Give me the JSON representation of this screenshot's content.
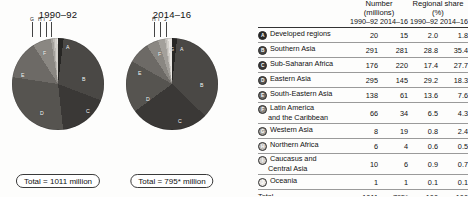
{
  "charts": [
    {
      "title": "1990–92",
      "total_label": "Total = 1011 million",
      "period": "1990-92",
      "leader_labels": [
        "G",
        "H",
        "I",
        "J"
      ],
      "inner_labels": [
        "A",
        "B",
        "C",
        "D",
        "E",
        "F"
      ]
    },
    {
      "title": "2014–16",
      "total_label": "Total = 795* million",
      "period": "2014-16",
      "leader_labels": [
        "H",
        "I",
        "J"
      ],
      "inner_labels": [
        "A",
        "B",
        "C",
        "D",
        "E",
        "F",
        "G"
      ]
    }
  ],
  "table": {
    "group_headers": [
      {
        "line1": "Number",
        "line2": "(millions)"
      },
      {
        "line1": "Regional share",
        "line2": "(%)"
      }
    ],
    "sub_headers": [
      "1990–92",
      "2014–16",
      "1990–92",
      "2014–16"
    ],
    "rows": [
      {
        "key": "A",
        "name": "Developed regions",
        "name2": "",
        "number_1990": "20",
        "number_2014": "15",
        "share_1990": "2.0",
        "share_2014": "1.8"
      },
      {
        "key": "B",
        "name": "Southern Asia",
        "name2": "",
        "number_1990": "291",
        "number_2014": "281",
        "share_1990": "28.8",
        "share_2014": "35.4"
      },
      {
        "key": "C",
        "name": "Sub-Saharan Africa",
        "name2": "",
        "number_1990": "176",
        "number_2014": "220",
        "share_1990": "17.4",
        "share_2014": "27.7"
      },
      {
        "key": "D",
        "name": "Eastern Asia",
        "name2": "",
        "number_1990": "295",
        "number_2014": "145",
        "share_1990": "29.2",
        "share_2014": "18.3"
      },
      {
        "key": "E",
        "name": "South-Eastern Asia",
        "name2": "",
        "number_1990": "138",
        "number_2014": "61",
        "share_1990": "13.6",
        "share_2014": "7.6"
      },
      {
        "key": "F",
        "name": "Latin America",
        "name2": "and the Caribbean",
        "number_1990": "66",
        "number_2014": "34",
        "share_1990": "6.5",
        "share_2014": "4.3"
      },
      {
        "key": "G",
        "name": "Western Asia",
        "name2": "",
        "number_1990": "8",
        "number_2014": "19",
        "share_1990": "0.8",
        "share_2014": "2.4"
      },
      {
        "key": "H",
        "name": "Northern Africa",
        "name2": "",
        "number_1990": "6",
        "number_2014": "4",
        "share_1990": "0.6",
        "share_2014": "0.5"
      },
      {
        "key": "I",
        "name": "Caucasus and",
        "name2": "Central Asia",
        "number_1990": "10",
        "number_2014": "6",
        "share_1990": "0.9",
        "share_2014": "0.7"
      },
      {
        "key": "J",
        "name": "Oceania",
        "name2": "",
        "number_1990": "1",
        "number_2014": "1",
        "share_1990": "0.1",
        "share_2014": "0.1"
      }
    ],
    "total_row": {
      "name": "Total",
      "number_1990": "1011",
      "number_2014": "795*",
      "share_1990": "100",
      "share_2014": "100"
    }
  },
  "series_colors": {
    "A": "#272624",
    "B": "#4a4845",
    "C": "#3a3836",
    "D": "#565450",
    "E": "#6d6a66",
    "F": "#8a8782",
    "G": "#a3a09b",
    "H": "#bdbab5",
    "I": "#d2cfca",
    "J": "#e9e6e2"
  },
  "chart_data": {
    "type": "pie",
    "legend_position": "right-table",
    "categories": [
      "Developed regions",
      "Southern Asia",
      "Sub-Saharan Africa",
      "Eastern Asia",
      "South-Eastern Asia",
      "Latin America and the Caribbean",
      "Western Asia",
      "Northern Africa",
      "Caucasus and Central Asia",
      "Oceania"
    ],
    "keys": [
      "A",
      "B",
      "C",
      "D",
      "E",
      "F",
      "G",
      "H",
      "I",
      "J"
    ],
    "series": [
      {
        "name": "1990–92",
        "unit": "millions",
        "values": [
          20,
          291,
          176,
          295,
          138,
          66,
          8,
          6,
          10,
          1
        ],
        "total": 1011,
        "shares_pct": [
          2.0,
          28.8,
          17.4,
          29.2,
          13.6,
          6.5,
          0.8,
          0.6,
          0.9,
          0.1
        ]
      },
      {
        "name": "2014–16",
        "unit": "millions",
        "values": [
          15,
          281,
          220,
          145,
          61,
          34,
          19,
          4,
          6,
          1
        ],
        "total": 795,
        "shares_pct": [
          1.8,
          35.4,
          27.7,
          18.3,
          7.6,
          4.3,
          2.4,
          0.5,
          0.7,
          0.1
        ]
      }
    ],
    "footnote_marker": "*"
  }
}
